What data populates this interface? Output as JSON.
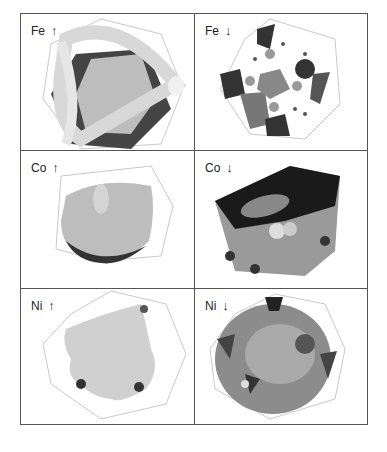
{
  "figure": {
    "panels": [
      {
        "element": "Fe",
        "spin": "↑",
        "spin_name": "up"
      },
      {
        "element": "Fe",
        "spin": "↓",
        "spin_name": "down"
      },
      {
        "element": "Co",
        "spin": "↑",
        "spin_name": "up"
      },
      {
        "element": "Co",
        "spin": "↓",
        "spin_name": "down"
      },
      {
        "element": "Ni",
        "spin": "↑",
        "spin_name": "up"
      },
      {
        "element": "Ni",
        "spin": "↓",
        "spin_name": "down"
      }
    ]
  }
}
